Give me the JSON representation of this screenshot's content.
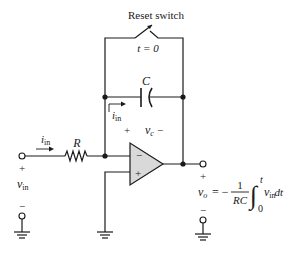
{
  "diagram": {
    "switch": {
      "label": "Reset switch",
      "time_label": "t = 0"
    },
    "capacitor": {
      "label": "C",
      "voltage_label": "v",
      "voltage_sub": "c",
      "plus": "+",
      "minus": "−"
    },
    "resistor": {
      "label": "R"
    },
    "current": {
      "symbol": "i",
      "sub": "in"
    },
    "opamp": {
      "inverting": "−",
      "noninverting": "+"
    },
    "input": {
      "plus": "+",
      "minus": "−",
      "symbol": "v",
      "sub": "in"
    },
    "output": {
      "plus": "+",
      "minus": "−",
      "symbol": "v",
      "sub": "o",
      "equals": "= −",
      "numerator": "1",
      "denominator": "RC",
      "integral_upper": "t",
      "integral_lower": "0",
      "integrand": "v",
      "integrand_sub": "in",
      "differential": "dt"
    },
    "colors": {
      "line": "#1a1a1a",
      "opamp_fill": "#d9d9d9",
      "background": "#ffffff"
    }
  }
}
